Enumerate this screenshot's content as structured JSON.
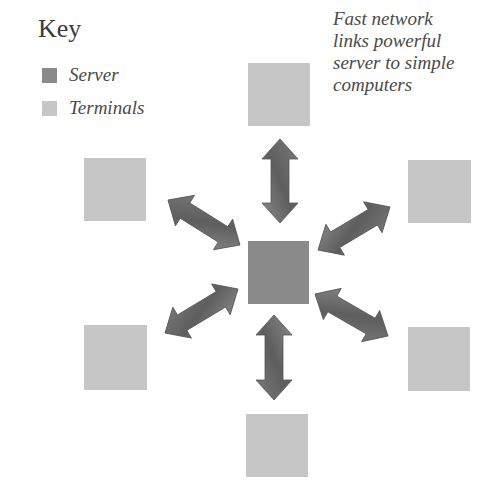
{
  "key": {
    "title": "Key",
    "items": [
      {
        "label": "Server",
        "color": "#8a8a8a"
      },
      {
        "label": "Terminals",
        "color": "#c6c6c6"
      }
    ]
  },
  "caption": {
    "lines": [
      "Fast network",
      "links powerful",
      "server to simple",
      "computers"
    ]
  },
  "colors": {
    "server": "#8a8a8a",
    "terminal": "#c6c6c6",
    "arrow": "#6e6e6e",
    "arrow_stroke": "#555555"
  },
  "diagram": {
    "server": {
      "label": "Server",
      "x": 248,
      "y": 241,
      "w": 61,
      "h": 63
    },
    "terminals": [
      {
        "position": "top",
        "x": 248,
        "y": 63,
        "w": 62,
        "h": 63
      },
      {
        "position": "top-right",
        "x": 408,
        "y": 160,
        "w": 63,
        "h": 63
      },
      {
        "position": "bottom-right",
        "x": 408,
        "y": 327,
        "w": 62,
        "h": 64
      },
      {
        "position": "bottom",
        "x": 246,
        "y": 414,
        "w": 62,
        "h": 63
      },
      {
        "position": "bottom-left",
        "x": 84,
        "y": 325,
        "w": 63,
        "h": 65
      },
      {
        "position": "top-left",
        "x": 84,
        "y": 158,
        "w": 62,
        "h": 63
      }
    ],
    "links": [
      {
        "from": "server",
        "to": "top",
        "x1": 280,
        "y1": 223,
        "x2": 280,
        "y2": 139
      },
      {
        "from": "server",
        "to": "top-right",
        "x1": 318,
        "y1": 250,
        "x2": 390,
        "y2": 207
      },
      {
        "from": "server",
        "to": "bottom-right",
        "x1": 315,
        "y1": 294,
        "x2": 388,
        "y2": 336
      },
      {
        "from": "server",
        "to": "bottom",
        "x1": 274,
        "y1": 315,
        "x2": 274,
        "y2": 400
      },
      {
        "from": "server",
        "to": "bottom-left",
        "x1": 238,
        "y1": 289,
        "x2": 165,
        "y2": 333
      },
      {
        "from": "server",
        "to": "top-left",
        "x1": 240,
        "y1": 245,
        "x2": 168,
        "y2": 200
      }
    ]
  }
}
